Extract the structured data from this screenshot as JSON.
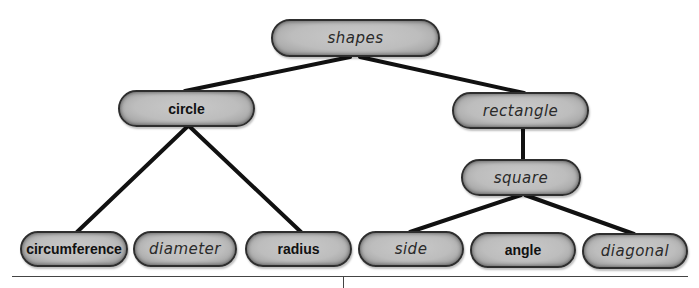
{
  "diagram": {
    "type": "tree",
    "colors": {
      "node_fill": "#bdbdbd",
      "node_border": "#2e2e2e",
      "edge": "#111111",
      "background": "#ffffff"
    },
    "nodes": {
      "shapes": {
        "label": "shapes",
        "style": "handwritten"
      },
      "circle": {
        "label": "circle",
        "style": "bold"
      },
      "rectangle": {
        "label": "rectangle",
        "style": "handwritten"
      },
      "square": {
        "label": "square",
        "style": "handwritten"
      },
      "circumference": {
        "label": "circumference",
        "style": "bold"
      },
      "diameter": {
        "label": "diameter",
        "style": "handwritten"
      },
      "radius": {
        "label": "radius",
        "style": "bold"
      },
      "side": {
        "label": "side",
        "style": "handwritten"
      },
      "angle": {
        "label": "angle",
        "style": "bold"
      },
      "diagonal": {
        "label": "diagonal",
        "style": "handwritten"
      }
    },
    "edges": [
      [
        "shapes",
        "circle"
      ],
      [
        "shapes",
        "rectangle"
      ],
      [
        "circle",
        "circumference"
      ],
      [
        "circle",
        "radius"
      ],
      [
        "rectangle",
        "square"
      ],
      [
        "square",
        "side"
      ],
      [
        "square",
        "diagonal"
      ]
    ]
  }
}
